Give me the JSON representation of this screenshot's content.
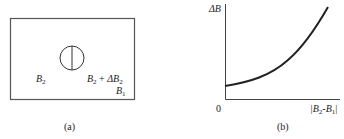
{
  "panel_a": {
    "label_left": {
      "base": "B",
      "sub": "2"
    },
    "label_right": {
      "base": "B",
      "sub": "2",
      "plus": "+",
      "delta": "ΔB",
      "delta_sub": "2"
    },
    "label_corner": {
      "base": "B",
      "sub": "1"
    },
    "caption": "(a)"
  },
  "panel_b": {
    "y_axis_label": "ΔB",
    "origin_label": "0",
    "x_axis_label": {
      "prefix": "|B",
      "sub1": "2",
      "mid": "-B",
      "sub2": "1",
      "suffix": "|"
    },
    "caption": "(b)"
  },
  "colors": {
    "line": "#222222",
    "frame": "#555555",
    "background": "#ffffff"
  }
}
